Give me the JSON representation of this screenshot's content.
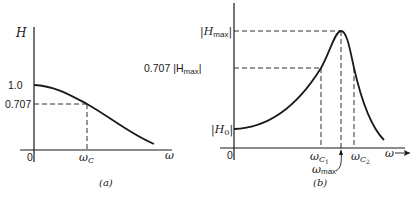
{
  "figure_a": {
    "caption": "(a)",
    "y_axis_label": "H",
    "x_axis_label": "ω",
    "origin_label": "0",
    "y_ticks": {
      "top": "1.0",
      "half_power": "0.707"
    },
    "x_ticks": {
      "cutoff": "ω",
      "cutoff_sub": "C"
    },
    "description": "Low-pass magnitude response: H starts at 1.0 and falls through 0.707 at ωC"
  },
  "figure_b": {
    "caption": "(b)",
    "x_axis_label": "ω",
    "origin_label": "0",
    "y_ticks": {
      "max": "|H",
      "max_sub": "max",
      "max_close": "|",
      "half_power_prefix": "0.707 |H",
      "half_power_sub": "max",
      "half_power_close": "|",
      "dc": "|H",
      "dc_sub": "0",
      "dc_close": "|"
    },
    "x_ticks": {
      "c1": "ω",
      "c1_sub": "C",
      "c1_subsub": "1",
      "c2": "ω",
      "c2_sub": "C",
      "c2_subsub": "2",
      "max": "ω",
      "max_sub": "max"
    },
    "description": "Resonant (band-pass-like) magnitude response: starts at |H0|, peaks at |Hmax| at ωmax, with half-power points ωC1 and ωC2"
  },
  "colors": {
    "ink": "#1a1a1a",
    "background": "#ffffff"
  }
}
